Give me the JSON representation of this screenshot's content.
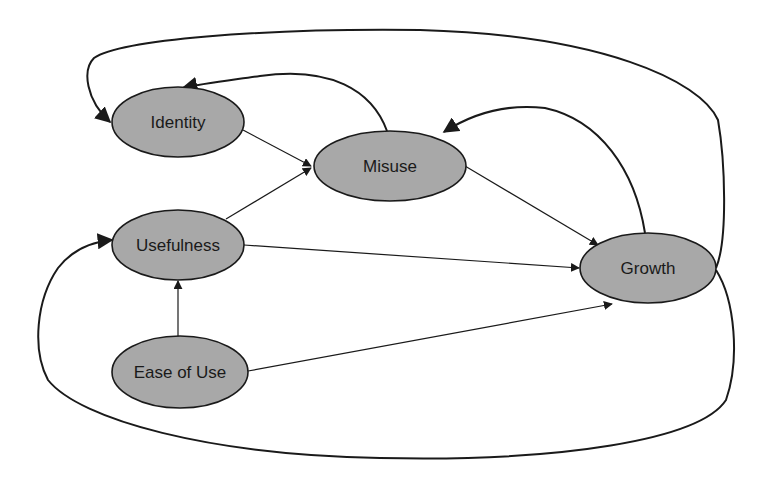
{
  "diagram": {
    "type": "causal-loop",
    "nodes": [
      {
        "id": "identity",
        "label": "Identity",
        "cx": 178,
        "cy": 122,
        "rx": 66,
        "ry": 35
      },
      {
        "id": "misuse",
        "label": "Misuse",
        "cx": 390,
        "cy": 166,
        "rx": 76,
        "ry": 35
      },
      {
        "id": "usefulness",
        "label": "Usefulness",
        "cx": 178,
        "cy": 245,
        "rx": 66,
        "ry": 35
      },
      {
        "id": "growth",
        "label": "Growth",
        "cx": 648,
        "cy": 268,
        "rx": 68,
        "ry": 35
      },
      {
        "id": "ease_of_use",
        "label": "Ease of Use",
        "cx": 180,
        "cy": 372,
        "rx": 68,
        "ry": 36
      }
    ],
    "edges": [
      {
        "from": "identity",
        "to": "misuse",
        "style": "straight"
      },
      {
        "from": "usefulness",
        "to": "misuse",
        "style": "straight"
      },
      {
        "from": "misuse",
        "to": "growth",
        "style": "straight"
      },
      {
        "from": "usefulness",
        "to": "growth",
        "style": "straight"
      },
      {
        "from": "ease_of_use",
        "to": "usefulness",
        "style": "straight"
      },
      {
        "from": "ease_of_use",
        "to": "growth",
        "style": "straight"
      },
      {
        "from": "misuse",
        "to": "identity",
        "style": "curved"
      },
      {
        "from": "growth",
        "to": "misuse",
        "style": "curved"
      },
      {
        "from": "growth",
        "to": "identity",
        "style": "curved-outer-top"
      },
      {
        "from": "growth",
        "to": "usefulness",
        "style": "curved-outer-bottom"
      }
    ],
    "colors": {
      "node_fill": "#a8a8a8",
      "stroke": "#1a1a1a",
      "background": "#ffffff"
    }
  }
}
